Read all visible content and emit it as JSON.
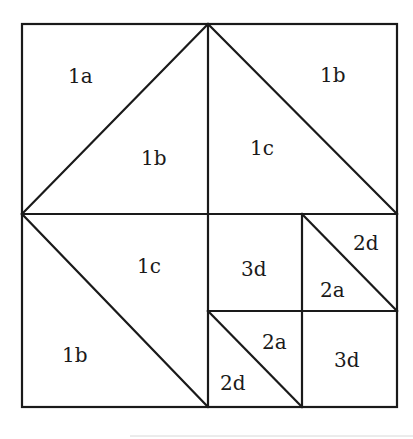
{
  "diagram": {
    "type": "quilt-block-piecing-diagram",
    "grid": {
      "x": [
        22,
        208,
        302,
        397
      ],
      "y": [
        24,
        214,
        311,
        407
      ]
    },
    "lines": [
      {
        "id": "diag-top-left",
        "x1": 22,
        "y1": 214,
        "x2": 208,
        "y2": 24
      },
      {
        "id": "diag-top-right",
        "x1": 208,
        "y1": 24,
        "x2": 397,
        "y2": 214
      },
      {
        "id": "diag-bottom-left",
        "x1": 22,
        "y1": 214,
        "x2": 208,
        "y2": 407
      },
      {
        "id": "diag-small-upper-right",
        "x1": 302,
        "y1": 214,
        "x2": 397,
        "y2": 311
      },
      {
        "id": "diag-small-lower-left",
        "x1": 208,
        "y1": 311,
        "x2": 302,
        "y2": 407
      }
    ],
    "labels": [
      {
        "text": "1a",
        "x": 68,
        "y": 83
      },
      {
        "text": "1b",
        "x": 141,
        "y": 165
      },
      {
        "text": "1b",
        "x": 320,
        "y": 82
      },
      {
        "text": "1c",
        "x": 250,
        "y": 155
      },
      {
        "text": "1c",
        "x": 137,
        "y": 273
      },
      {
        "text": "1b",
        "x": 62,
        "y": 362
      },
      {
        "text": "3d",
        "x": 241,
        "y": 276
      },
      {
        "text": "2d",
        "x": 353,
        "y": 250
      },
      {
        "text": "2a",
        "x": 320,
        "y": 297
      },
      {
        "text": "2a",
        "x": 262,
        "y": 349
      },
      {
        "text": "2d",
        "x": 220,
        "y": 390
      },
      {
        "text": "3d",
        "x": 334,
        "y": 367
      }
    ]
  }
}
